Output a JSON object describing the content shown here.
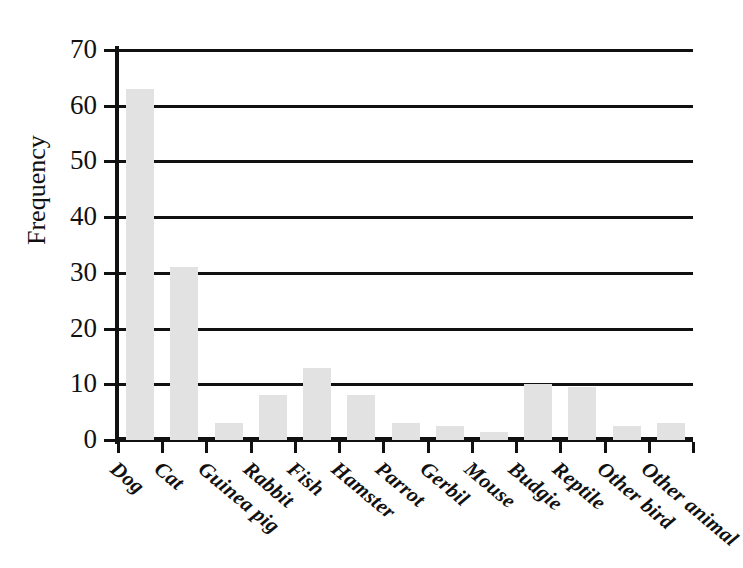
{
  "chart_data": {
    "type": "bar",
    "title": "",
    "subtitle": "",
    "xlabel": "",
    "ylabel": "Frequency",
    "categories": [
      "Dog",
      "Cat",
      "Guinea pig",
      "Rabbit",
      "Fish",
      "Hamster",
      "Parrot",
      "Gerbil",
      "Mouse",
      "Budgie",
      "Reptile",
      "Other bird",
      "Other animal"
    ],
    "values": [
      63,
      31,
      3,
      8,
      13,
      8,
      3,
      2.5,
      1.5,
      10,
      9.5,
      2.5,
      3
    ],
    "ylim": [
      0,
      70
    ],
    "ytick_labels": [
      "0",
      "10",
      "20",
      "30",
      "40",
      "50",
      "60",
      "70"
    ],
    "ytick_values": [
      0,
      10,
      20,
      30,
      40,
      50,
      60,
      70
    ],
    "grid": "horizontal",
    "legend": "none",
    "bar_color": "#e2e2e2",
    "axis_color": "#111111",
    "xtick_label_rotation": -40
  }
}
